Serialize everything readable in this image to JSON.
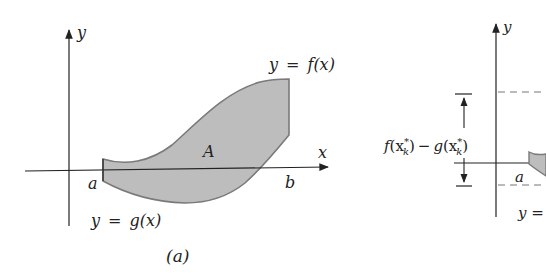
{
  "figure": {
    "panels": [
      {
        "id": "a",
        "caption": "(a)",
        "axes": {
          "x_label": "x",
          "y_label": "y"
        },
        "curves": {
          "upper": {
            "label": "y = f(x)",
            "label_y": "y",
            "label_eq": "=",
            "label_fn": "f(x)"
          },
          "lower": {
            "label": "y = g(x)",
            "label_y": "y",
            "label_eq": "=",
            "label_fn": "g(x)"
          }
        },
        "region_label": "A",
        "bounds": {
          "left": "a",
          "right": "b"
        },
        "colors": {
          "region_fill": "#bdbdbd",
          "region_stroke": "#7a7a7a",
          "axis": "#222222"
        }
      },
      {
        "id": "b",
        "axes": {
          "y_label": "y"
        },
        "height_label": {
          "text": "f(x_k*) − g(x_k*)",
          "f": "f",
          "open1": "(x",
          "sub1": "k",
          "sup1": "*",
          "close1": ")",
          "minus": "−",
          "g": "g",
          "open2": "(x",
          "sub2": "k",
          "sup2": "*",
          "close2": ")"
        },
        "bounds": {
          "left": "a"
        },
        "partial_label": "y ="
      }
    ]
  }
}
